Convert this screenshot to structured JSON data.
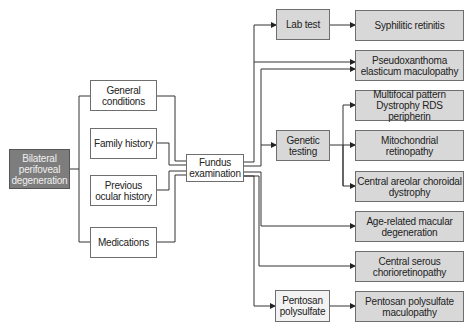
{
  "diagram": {
    "start": {
      "label": "Bilateral perifoveal degeneration",
      "lines": [
        "Bilateral",
        "perifoveal",
        "degeneration"
      ]
    },
    "inputs": [
      {
        "id": "general",
        "lines": [
          "General",
          "conditions"
        ]
      },
      {
        "id": "family",
        "lines": [
          "Family history"
        ]
      },
      {
        "id": "previous",
        "lines": [
          "Previous",
          "ocular history"
        ]
      },
      {
        "id": "medications",
        "lines": [
          "Medications"
        ]
      }
    ],
    "hub": {
      "lines": [
        "Fundus",
        "examination"
      ]
    },
    "tests": [
      {
        "id": "lab",
        "lines": [
          "Lab test"
        ]
      },
      {
        "id": "genetic",
        "lines": [
          "Genetic",
          "testing"
        ]
      },
      {
        "id": "pentosan",
        "lines": [
          "Pentosan",
          "polysulfate"
        ]
      }
    ],
    "outcomes": [
      {
        "id": "syphilitic",
        "lines": [
          "Syphilitic retinitis"
        ]
      },
      {
        "id": "pxe",
        "lines": [
          "Pseudoxanthoma",
          "elasticum maculopathy"
        ]
      },
      {
        "id": "multifocal",
        "lines": [
          "Multifocal pattern",
          "Dystrophy RDS peripherin"
        ]
      },
      {
        "id": "mito",
        "lines": [
          "Mitochondrial",
          "retinopathy"
        ]
      },
      {
        "id": "cacd",
        "lines": [
          "Central areolar choroidal",
          "dystrophy"
        ]
      },
      {
        "id": "amd",
        "lines": [
          "Age-related macular",
          "degeneration"
        ]
      },
      {
        "id": "csc",
        "lines": [
          "Central serous",
          "chorioretinopathy"
        ]
      },
      {
        "id": "ppm",
        "lines": [
          "Pentosan polysulfate",
          "maculopathy"
        ]
      }
    ]
  },
  "colors": {
    "start_fill": "#7d7d7d",
    "test_fill": "#d8d8d8",
    "input_fill": "#ffffff",
    "line": "#333333"
  }
}
